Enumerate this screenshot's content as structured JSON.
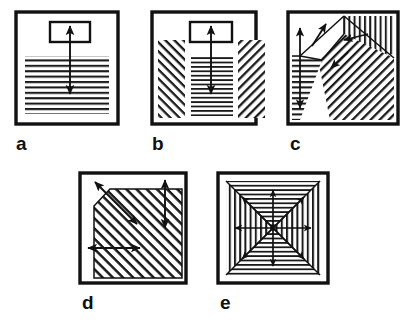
{
  "figure": {
    "background_color": "#ffffff",
    "ink_color": "#111111",
    "hatch_color": "#1a1a1a",
    "panel_count": 5
  },
  "panels": [
    {
      "id": "a",
      "label": "a",
      "label_x": 16,
      "label_y": 134,
      "frame": {
        "x": 16,
        "y": 12,
        "w": 102,
        "h": 112
      },
      "description": "Square frame with small open rectangle near top and full-width horizontal hatching below, crossed by one vertical double-headed arrow",
      "hatch_zones": [
        {
          "name": "lower-horizontal-hatch",
          "pattern": "horizontal",
          "x": 25,
          "y": 56,
          "w": 84,
          "h": 58
        }
      ],
      "inner_rect": {
        "x": 50,
        "y": 22,
        "w": 40,
        "h": 20
      },
      "arrows": [
        {
          "name": "vertical-double-arrow",
          "x1": 70,
          "y1": 24,
          "x2": 70,
          "y2": 96,
          "heads": "both",
          "orientation": "vertical"
        }
      ]
    },
    {
      "id": "b",
      "label": "b",
      "label_x": 152,
      "label_y": 134,
      "frame": {
        "x": 152,
        "y": 12,
        "w": 104,
        "h": 112
      },
      "description": "Square frame with narrow central horizontal hatch band flanked by two diagonal hatch bands of opposite slope, small rectangle at top, vertical double-headed arrow",
      "hatch_zones": [
        {
          "name": "left-diagonal-hatch",
          "pattern": "diagonal-backslash",
          "x": 158,
          "y": 40,
          "w": 28,
          "h": 78
        },
        {
          "name": "center-horizontal-hatch",
          "pattern": "horizontal",
          "x": 190,
          "y": 56,
          "w": 44,
          "h": 62
        },
        {
          "name": "right-diagonal-hatch",
          "pattern": "diagonal-slash",
          "x": 238,
          "y": 40,
          "w": 28,
          "h": 78
        }
      ],
      "inner_rect": {
        "x": 190,
        "y": 22,
        "w": 42,
        "h": 20
      },
      "arrows": [
        {
          "name": "vertical-double-arrow",
          "x1": 211,
          "y1": 24,
          "x2": 211,
          "y2": 96,
          "heads": "both",
          "orientation": "vertical"
        }
      ]
    },
    {
      "id": "c",
      "label": "c",
      "label_x": 290,
      "label_y": 134,
      "frame": {
        "x": 288,
        "y": 12,
        "w": 110,
        "h": 112
      },
      "description": "Square frame with fan of hatched sectors radiating from an interior pivot: vertical hatch top-right, large diagonal hatch center-right, horizontal hatch wedge bottom-left; four single-headed arrows point outward from the pivot",
      "hatch_zones": [
        {
          "name": "vertical-hatch-zone",
          "pattern": "vertical"
        },
        {
          "name": "diagonal-hatch-zone",
          "pattern": "diagonal-slash"
        },
        {
          "name": "horizontal-hatch-zone",
          "pattern": "horizontal"
        }
      ],
      "arrows": [
        {
          "name": "upper-left-arrow",
          "heads": "single",
          "orientation": "up-left"
        },
        {
          "name": "up-arrow",
          "heads": "single",
          "orientation": "up"
        },
        {
          "name": "down-arrow",
          "heads": "single",
          "orientation": "down"
        },
        {
          "name": "right-arrow",
          "heads": "single",
          "orientation": "right"
        },
        {
          "name": "down-right-arrow",
          "heads": "single",
          "orientation": "down-right"
        }
      ]
    },
    {
      "id": "d",
      "label": "d",
      "label_x": 82,
      "label_y": 293,
      "frame": {
        "x": 80,
        "y": 173,
        "w": 106,
        "h": 110
      },
      "description": "Square frame containing a large diagonally hatched block whose upper-left corner is chamfered; three double-headed arrows: one normal to the chamfer, one vertical at right, one horizontal at lower left",
      "hatch_zones": [
        {
          "name": "main-diagonal-hatch",
          "pattern": "diagonal-slash"
        }
      ],
      "arrows": [
        {
          "name": "chamfer-double-arrow",
          "heads": "both",
          "orientation": "diagonal-up-left"
        },
        {
          "name": "vertical-double-arrow",
          "heads": "both",
          "orientation": "vertical"
        },
        {
          "name": "horizontal-double-arrow",
          "heads": "both",
          "orientation": "horizontal"
        }
      ]
    },
    {
      "id": "e",
      "label": "e",
      "label_x": 220,
      "label_y": 293,
      "frame": {
        "x": 218,
        "y": 173,
        "w": 110,
        "h": 110
      },
      "description": "Square frame divided by both diagonals into four triangular sectors; top and bottom sectors horizontally hatched, left and right sectors vertically hatched; eight arrows radiate from the centre to the four corners and four edge midpoints",
      "hatch_zones": [
        {
          "name": "top-horizontal-hatch",
          "pattern": "horizontal"
        },
        {
          "name": "bottom-horizontal-hatch",
          "pattern": "horizontal"
        },
        {
          "name": "left-vertical-hatch",
          "pattern": "vertical"
        },
        {
          "name": "right-vertical-hatch",
          "pattern": "vertical"
        }
      ],
      "arrows": [
        {
          "name": "up-arrow",
          "heads": "single",
          "orientation": "up"
        },
        {
          "name": "down-arrow",
          "heads": "single",
          "orientation": "down"
        },
        {
          "name": "left-arrow",
          "heads": "single",
          "orientation": "left"
        },
        {
          "name": "right-arrow",
          "heads": "single",
          "orientation": "right"
        },
        {
          "name": "up-left-arrow",
          "heads": "single",
          "orientation": "up-left"
        },
        {
          "name": "up-right-arrow",
          "heads": "single",
          "orientation": "up-right"
        },
        {
          "name": "down-left-arrow",
          "heads": "single",
          "orientation": "down-left"
        },
        {
          "name": "down-right-arrow",
          "heads": "single",
          "orientation": "down-right"
        }
      ]
    }
  ]
}
